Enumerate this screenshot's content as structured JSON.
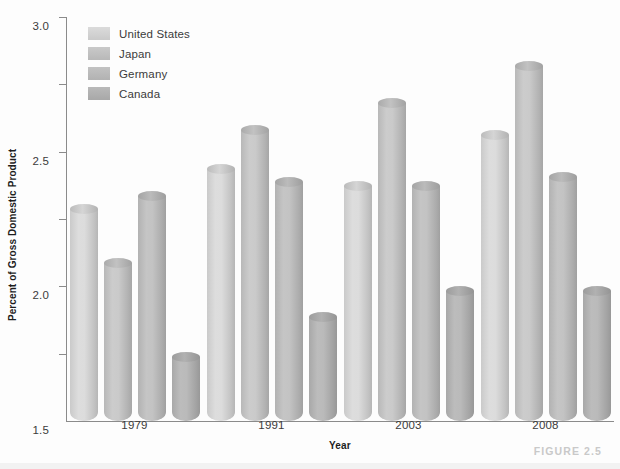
{
  "chart_data": {
    "type": "bar",
    "title": "",
    "subtitle": "",
    "xlabel": "Year",
    "ylabel": "Percent of Gross Domestic Product",
    "categories": [
      "1979",
      "1991",
      "2003",
      "2008"
    ],
    "series": [
      {
        "name": "United States",
        "color": "#d9d9d9",
        "values": [
          1.61,
          1.91,
          1.78,
          2.16
        ]
      },
      {
        "name": "Japan",
        "color": "#c6c6c6",
        "values": [
          1.21,
          2.2,
          2.4,
          2.67
        ]
      },
      {
        "name": "Germany",
        "color": "#bfbfbf",
        "values": [
          1.71,
          1.81,
          1.78,
          1.85
        ]
      },
      {
        "name": "Canada",
        "color": "#b5b5b5",
        "values": [
          0.51,
          0.81,
          1.0,
          1.0
        ]
      }
    ],
    "ylim": [
      0,
      3.0
    ],
    "y_ticks": [
      "0.5",
      "1.0",
      "1.5",
      "2.0",
      "2.5",
      "3.0"
    ],
    "y_tick_values": [
      0.5,
      1.0,
      1.5,
      2.0,
      2.5,
      3.0
    ],
    "grid": false,
    "legend_position": "top-left",
    "legend_entries": [
      "United States",
      "Japan",
      "Germany",
      "Canada"
    ]
  },
  "caption": {
    "figure_label": "FIGURE 2.5"
  },
  "colors": {
    "axis": "#8b8b8b",
    "tick_text": "#3b3b3b",
    "axis_title": "#1d1d1d",
    "caption": "#c9c9c9",
    "background": "#fdfdfd"
  }
}
